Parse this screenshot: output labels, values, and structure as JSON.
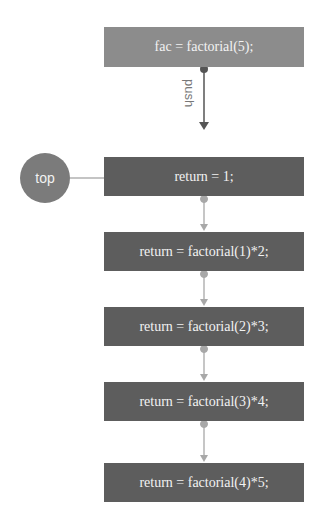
{
  "diagram": {
    "call": {
      "label": "fac = factorial(5);",
      "color": "#8c8c8c"
    },
    "push_label": "push",
    "top_pointer": {
      "label": "top",
      "color": "#7b7b7b"
    },
    "stack_frames": [
      {
        "label": "return = 1;"
      },
      {
        "label": "return = factorial(1)*2;"
      },
      {
        "label": "return = factorial(2)*3;"
      },
      {
        "label": "return = factorial(3)*4;"
      },
      {
        "label": "return = factorial(4)*5;"
      }
    ],
    "colors": {
      "frame": "#5d5d5d",
      "connector": "#a8a8a8",
      "push_arrow": "#555555"
    }
  }
}
